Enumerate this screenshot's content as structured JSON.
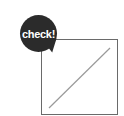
{
  "badge": {
    "label": "check!",
    "color": "#2b2b2b",
    "text_color": "#ffffff"
  },
  "placeholder_box": {
    "icon": "empty-image-placeholder",
    "border_color": "#6a6a6a",
    "diagonal_color": "#9a9a9a"
  }
}
